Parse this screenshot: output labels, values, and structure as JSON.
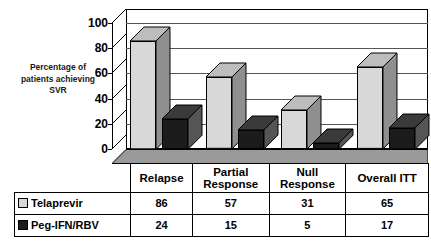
{
  "chart_data": {
    "type": "bar",
    "title": "",
    "subtitle": "",
    "xlabel": "",
    "ylabel": "Percentage of patients achieving SVR",
    "ylim": [
      0,
      100
    ],
    "ytick_labels": [
      "0",
      "20",
      "40",
      "60",
      "80",
      "100"
    ],
    "ytick_values": [
      0,
      20,
      40,
      60,
      80,
      100
    ],
    "grid": true,
    "legend_position": "bottom-table",
    "style": "3d-column",
    "categories": [
      "Relapse",
      "Partial Response",
      "Null Response",
      "Overall ITT"
    ],
    "series": [
      {
        "name": "Telaprevir",
        "values": [
          86,
          57,
          31,
          65
        ],
        "color": "#d8d8d8",
        "side_color": "#8f8f8f",
        "top_color": "#bdbdbd"
      },
      {
        "name": "Peg-IFN/RBV",
        "values": [
          24,
          15,
          5,
          17
        ],
        "color": "#1c1c1c",
        "side_color": "#555555",
        "top_color": "#3a3a3a"
      }
    ]
  },
  "axis": {
    "title_line1": "Percentage of",
    "title_line2": "patients achieving",
    "title_line3": "SVR"
  },
  "table": {
    "header_blank": "",
    "headers": [
      "Relapse",
      "Partial Response",
      "Null Response",
      "Overall ITT"
    ],
    "header_cells": [
      {
        "line1": "Relapse",
        "line2": ""
      },
      {
        "line1": "Partial",
        "line2": "Response"
      },
      {
        "line1": "Null",
        "line2": "Response"
      },
      {
        "line1": "Overall ITT",
        "line2": ""
      }
    ],
    "rows": [
      {
        "label": "Telaprevir",
        "swatch": "light-square-icon",
        "values": [
          "86",
          "57",
          "31",
          "65"
        ]
      },
      {
        "label": "Peg-IFN/RBV",
        "swatch": "dark-square-icon",
        "values": [
          "24",
          "15",
          "5",
          "17"
        ]
      }
    ]
  },
  "colors": {
    "series1": "#d8d8d8",
    "series2": "#1c1c1c",
    "axis": "#000000",
    "grid": "#555555",
    "floor": "#9a9a9a",
    "background": "#ffffff"
  }
}
